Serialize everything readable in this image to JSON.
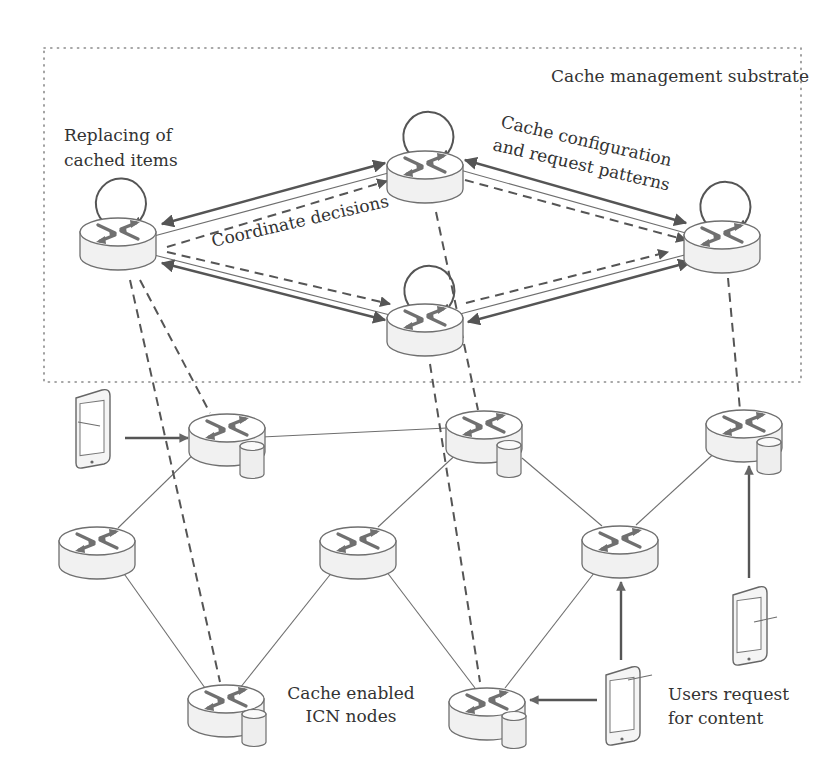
{
  "labels": {
    "substrate": "Cache management substrate",
    "replacing_line1": "Replacing of",
    "replacing_line2": "cached items",
    "coordinate": "Coordinate decisions",
    "cache_config_line1": "Cache configuration",
    "cache_config_line2": "and request patterns",
    "icn_line1": "Cache enabled",
    "icn_line2": "ICN nodes",
    "users_line1": "Users request",
    "users_line2": "for content"
  },
  "colors": {
    "stroke": "#555555",
    "light_stroke": "#6e6e6e",
    "node_fill": "#f1f1f1",
    "text": "#333333"
  },
  "nodes": {
    "management": [
      {
        "id": "m-left",
        "cache": false,
        "loop": true
      },
      {
        "id": "m-top",
        "cache": false,
        "loop": true
      },
      {
        "id": "m-middle",
        "cache": false,
        "loop": true
      },
      {
        "id": "m-right",
        "cache": false,
        "loop": true
      }
    ],
    "network": [
      {
        "id": "n1",
        "cache": true
      },
      {
        "id": "n2",
        "cache": true
      },
      {
        "id": "n3",
        "cache": true
      },
      {
        "id": "n4",
        "cache": false
      },
      {
        "id": "n5",
        "cache": false
      },
      {
        "id": "n6",
        "cache": false
      },
      {
        "id": "n7",
        "cache": true
      },
      {
        "id": "n8",
        "cache": true
      }
    ],
    "devices": [
      {
        "id": "tablet-left",
        "requests": "n1"
      },
      {
        "id": "tablet-right",
        "requests": "n3"
      },
      {
        "id": "tablet-bottom",
        "requests": "n8"
      }
    ]
  },
  "edges": {
    "network_links": [
      [
        "n1",
        "n2"
      ],
      [
        "n1",
        "n4"
      ],
      [
        "n4",
        "n7"
      ],
      [
        "n7",
        "n5"
      ],
      [
        "n5",
        "n2"
      ],
      [
        "n2",
        "n6"
      ],
      [
        "n6",
        "n3"
      ],
      [
        "n5",
        "n8"
      ],
      [
        "n8",
        "n6"
      ]
    ],
    "management_links": [
      [
        "m-left",
        "m-top"
      ],
      [
        "m-left",
        "m-middle"
      ],
      [
        "m-top",
        "m-right"
      ],
      [
        "m-middle",
        "m-right"
      ]
    ],
    "mapping_dashed": [
      [
        "m-left",
        "n1"
      ],
      [
        "m-left",
        "n7"
      ],
      [
        "m-top",
        "n2"
      ],
      [
        "m-middle",
        "n8"
      ],
      [
        "m-right",
        "n3"
      ]
    ]
  }
}
